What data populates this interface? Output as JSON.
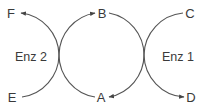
{
  "diagram": {
    "type": "coupled-reaction-cycle",
    "stroke_color": "#555555",
    "text_color": "#3a3a3a",
    "nodes": {
      "F": {
        "label": "F"
      },
      "B": {
        "label": "B"
      },
      "C": {
        "label": "C"
      },
      "E": {
        "label": "E"
      },
      "A": {
        "label": "A"
      },
      "D": {
        "label": "D"
      }
    },
    "enzymes": {
      "enz2": {
        "label": "Enz 2"
      },
      "enz1": {
        "label": "Enz 1"
      }
    },
    "reactions": [
      {
        "from": "E",
        "to": "F",
        "enzyme": "Enz 2",
        "arrowhead_at": "F"
      },
      {
        "from": "A",
        "to": "B",
        "enzyme": "Enz 2",
        "arrowhead_at": "B"
      },
      {
        "from": "B",
        "to": "A",
        "enzyme": "Enz 1",
        "arrowhead_at": "A"
      },
      {
        "from": "C",
        "to": "D",
        "enzyme": "Enz 1",
        "arrowhead_at": "D"
      }
    ]
  }
}
